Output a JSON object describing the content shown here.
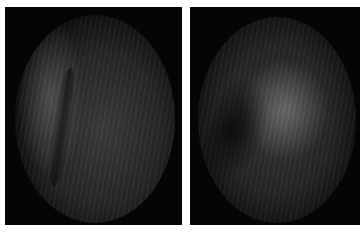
{
  "figure": {
    "panels": [
      {
        "id": "left",
        "description": "endoscopic view, oval field, dark mucosal fold on left"
      },
      {
        "id": "right",
        "description": "endoscopic view, oval field, dark fold lower-left, brighter center"
      }
    ],
    "colors": {
      "background": "#ffffff",
      "panel": "#050505",
      "tissue_mid": "#3a3a3a",
      "tissue_highlight": "#6e6e6e"
    }
  }
}
